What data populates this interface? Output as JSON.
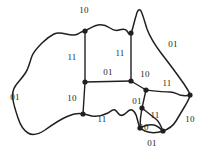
{
  "figure": {
    "name": "australia-region-graph",
    "width": 207,
    "height": 156,
    "background_color": "#ffffff",
    "ink_color": "#231f20"
  },
  "labels": [
    {
      "id": "label-northern-top",
      "text": "10",
      "x": 84,
      "y": 10,
      "anchor": "center"
    },
    {
      "id": "label-western-interior",
      "text": "11",
      "x": 72,
      "y": 57,
      "anchor": "center"
    },
    {
      "id": "label-northern-interior",
      "text": "11",
      "x": 120,
      "y": 53,
      "anchor": "center"
    },
    {
      "id": "label-center-horizontal",
      "text": "01",
      "x": 108,
      "y": 72,
      "anchor": "center"
    },
    {
      "id": "label-queensland-coast",
      "text": "01",
      "x": 173,
      "y": 44,
      "anchor": "center"
    },
    {
      "id": "label-center-right",
      "text": "10",
      "x": 145,
      "y": 74,
      "anchor": "center"
    },
    {
      "id": "label-new-south-wales",
      "text": "11",
      "x": 167,
      "y": 83,
      "anchor": "center"
    },
    {
      "id": "label-western-coast",
      "text": "01",
      "x": 15,
      "y": 97,
      "anchor": "center"
    },
    {
      "id": "label-south-west-interior",
      "text": "10",
      "x": 72,
      "y": 98,
      "anchor": "center"
    },
    {
      "id": "label-south-australia",
      "text": "01",
      "x": 137,
      "y": 101,
      "anchor": "center"
    },
    {
      "id": "label-south-coast",
      "text": "11",
      "x": 102,
      "y": 119,
      "anchor": "center"
    },
    {
      "id": "label-victoria-upper",
      "text": "11",
      "x": 155,
      "y": 115,
      "anchor": "center"
    },
    {
      "id": "label-east-coast-lower",
      "text": "10",
      "x": 190,
      "y": 119,
      "anchor": "center"
    },
    {
      "id": "label-victoria-lower",
      "text": "10",
      "x": 144,
      "y": 127,
      "anchor": "center"
    },
    {
      "id": "label-tasmania",
      "text": "01",
      "x": 152,
      "y": 143,
      "anchor": "center"
    }
  ],
  "nodes": [
    {
      "id": "node-nw-top",
      "x": 85,
      "y": 31
    },
    {
      "id": "node-ne-top",
      "x": 131,
      "y": 33
    },
    {
      "id": "node-center",
      "x": 85,
      "y": 82
    },
    {
      "id": "node-center-east",
      "x": 131,
      "y": 81
    },
    {
      "id": "node-tri-east",
      "x": 146,
      "y": 90
    },
    {
      "id": "node-far-east",
      "x": 190,
      "y": 95
    },
    {
      "id": "node-south-west",
      "x": 83,
      "y": 114
    },
    {
      "id": "node-vic-north",
      "x": 142,
      "y": 108
    },
    {
      "id": "node-vic-west",
      "x": 140,
      "y": 128
    },
    {
      "id": "node-vic-south",
      "x": 163,
      "y": 131
    }
  ],
  "paths": {
    "coastline": "M85,31 C90,28 94,26 98,25 C103,24 107,26 110,28 C113,30 116,31 119,30 C122,29 125,28 127,31 C129,34 130,36 131,33 C133,29 134,22 136,16 C137,11 139,8 141,11 C143,15 145,23 147,29 C150,37 155,45 161,53 C168,62 177,74 184,84 C188,90 190,93 190,95 C190,98 187,102 185,106 C182,111 179,116 176,121 C173,126 169,129 163,131 C157,133 150,133 145,131 C141,129 140,128 140,128 C139,126 138,122 137,118 C136,114 134,111 132,110 C130,109 128,111 126,113 C124,115 122,116 120,115 C118,114 117,111 115,110 C113,109 111,111 108,113 C104,115 98,117 92,116 C88,115 85,114 83,114 C79,113 73,114 66,117 C59,120 52,125 45,130 C39,134 33,136 28,133 C23,130 20,124 18,118 C16,112 14,106 13,100 C12,94 13,89 16,85 C19,81 23,77 26,72 C29,67 30,61 32,56 C34,51 38,47 42,43 C46,39 50,36 54,34 C58,32 62,33 66,34 C70,35 74,36 78,34 C81,32 83,31 85,31 Z",
    "border_nw_vertical": "M85,31 L85,82",
    "border_ne_vertical": "M131,33 L131,81",
    "border_center_horizontal": "M85,82 L131,81",
    "border_center_south_vertical": "M85,82 L83,114",
    "border_center_to_tri": "M131,81 L146,90",
    "border_tri_east": "M146,90 C155,91 163,92 170,92 C174,92 177,94 180,95 C184,96 187,96 190,95",
    "border_sa_east_vertical": "M146,90 L142,108",
    "border_sa_south": "M142,108 C141,113 140,120 140,128",
    "border_vic_north": "M142,108 C147,112 152,116 157,120 C159,122 161,126 163,131",
    "border_vic_south": "M140,128 C144,126 149,124 154,125 C158,126 161,129 163,131",
    "border_south_coast_seg": "M83,114 C88,115 92,116 98,115 C104,114 110,112 115,110"
  }
}
